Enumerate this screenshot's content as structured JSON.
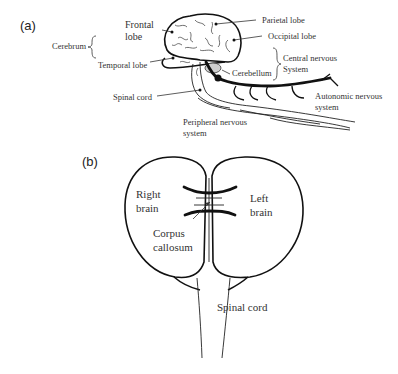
{
  "figure": {
    "panel_a": {
      "label": "(a)",
      "labels": {
        "frontal_lobe_1": "Frontal",
        "frontal_lobe_2": "lobe",
        "parietal_lobe": "Parietal lobe",
        "occipital_lobe": "Occipital lobe",
        "cerebrum": "Cerebrum",
        "temporal_lobe": "Temporal lobe",
        "cerebellum": "Cerebellum",
        "central_nervous_1": "Central nervous",
        "central_nervous_2": "System",
        "spinal_cord": "Spinal cord",
        "autonomic_1": "Autonomic nervous",
        "autonomic_2": "system",
        "peripheral_1": "Peripheral nervous",
        "peripheral_2": "system"
      }
    },
    "panel_b": {
      "label": "(b)",
      "labels": {
        "right_brain_1": "Right",
        "right_brain_2": "brain",
        "left_brain_1": "Left",
        "left_brain_2": "brain",
        "corpus_1": "Corpus",
        "corpus_2": "callosum",
        "spinal_cord": "Spinal cord"
      }
    }
  }
}
